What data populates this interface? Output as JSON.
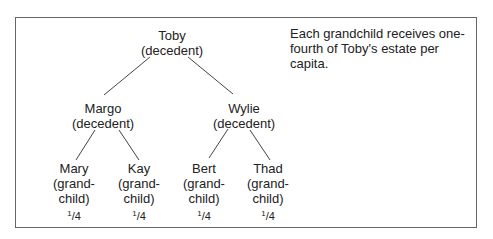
{
  "diagram": {
    "note": "Each grandchild receives one-fourth of Toby's estate per capita.",
    "root": {
      "name": "Toby",
      "role": "(decedent)"
    },
    "children": [
      {
        "name": "Margo",
        "role": "(decedent)"
      },
      {
        "name": "Wylie",
        "role": "(decedent)"
      }
    ],
    "grandchildren": [
      {
        "name": "Mary",
        "role1": "(grand-",
        "role2": "child)",
        "share_num": "1",
        "share_den": "/4"
      },
      {
        "name": "Kay",
        "role1": "(grand-",
        "role2": "child)",
        "share_num": "1",
        "share_den": "/4"
      },
      {
        "name": "Bert",
        "role1": "(grand-",
        "role2": "child)",
        "share_num": "1",
        "share_den": "/4"
      },
      {
        "name": "Thad",
        "role1": "(grand-",
        "role2": "child)",
        "share_num": "1",
        "share_den": "/4"
      }
    ]
  }
}
